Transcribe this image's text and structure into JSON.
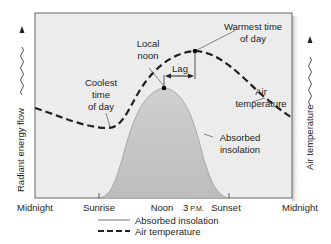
{
  "diagram": {
    "y_axis_left": "Radiant energy flow",
    "y_axis_right": "Air temperature",
    "x_labels": [
      "Midnight",
      "Sunrise",
      "Noon",
      "3",
      "P.M.",
      "Sunset",
      "Midnight"
    ],
    "annotations": {
      "local_noon_1": "Local",
      "local_noon_2": "noon",
      "coolest_1": "Coolest",
      "coolest_2": "time",
      "coolest_3": "of day",
      "warmest_1": "Warmest time",
      "warmest_2": "of day",
      "lag": "Lag",
      "air_temp_1": "Air",
      "air_temp_2": "temperature",
      "insolation_1": "Absorbed",
      "insolation_2": "insolation"
    },
    "legend": [
      {
        "label": "Absorbed insolation",
        "style": "solid",
        "color": "#b3b3b3"
      },
      {
        "label": "Air temperature",
        "style": "dashed",
        "color": "#231f20"
      }
    ],
    "colors": {
      "plot_bg": "#ececec",
      "insolation_fill": "#c4c4c4",
      "frame": "#555555"
    }
  }
}
